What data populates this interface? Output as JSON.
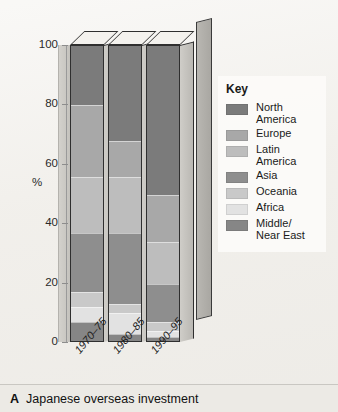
{
  "caption": {
    "letter": "A",
    "text": "Japanese overseas investment"
  },
  "legend": {
    "title": "Key",
    "items": [
      {
        "label": "North\nAmerica",
        "color": "#7b7b7b"
      },
      {
        "label": "Europe",
        "color": "#a8a8a8"
      },
      {
        "label": "Latin\nAmerica",
        "color": "#bdbdbd"
      },
      {
        "label": "Asia",
        "color": "#8e8e8e"
      },
      {
        "label": "Oceania",
        "color": "#c9c9c9"
      },
      {
        "label": "Africa",
        "color": "#e2e2e2"
      },
      {
        "label": "Middle/\nNear East",
        "color": "#868686"
      }
    ]
  },
  "chart_data": {
    "type": "bar",
    "stacked": true,
    "title": "Japanese overseas investment",
    "xlabel": "",
    "ylabel": "%",
    "ylim": [
      0,
      100
    ],
    "yticks": [
      0,
      20,
      40,
      60,
      80,
      100
    ],
    "grid": false,
    "legend_position": "right",
    "categories": [
      "1970–75",
      "1980–85",
      "1990–95"
    ],
    "series": [
      {
        "name": "North America",
        "color": "#7b7b7b",
        "values": [
          20,
          32,
          50
        ]
      },
      {
        "name": "Europe",
        "color": "#a8a8a8",
        "values": [
          24,
          12,
          16
        ]
      },
      {
        "name": "Latin America",
        "color": "#bdbdbd",
        "values": [
          19,
          19,
          14
        ]
      },
      {
        "name": "Asia",
        "color": "#8e8e8e",
        "values": [
          20,
          24,
          13
        ]
      },
      {
        "name": "Oceania",
        "color": "#c9c9c9",
        "values": [
          5,
          3,
          3
        ]
      },
      {
        "name": "Africa",
        "color": "#e2e2e2",
        "values": [
          5,
          7,
          2
        ]
      },
      {
        "name": "Middle/Near East",
        "color": "#868686",
        "values": [
          7,
          3,
          2
        ]
      }
    ]
  },
  "axis": {
    "unit": "%",
    "ticks": [
      "100",
      "80",
      "60",
      "40",
      "20",
      "0"
    ]
  }
}
